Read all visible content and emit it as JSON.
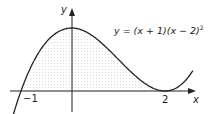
{
  "diagram": {
    "equation": "y = (x + 1)(x − 2)",
    "equation_exponent": "2",
    "x_axis_label": "x",
    "y_axis_label": "y",
    "x_ticks": [
      "−1",
      "2"
    ],
    "curve_color": "#222222",
    "shade_color": "#eeeeee"
  }
}
